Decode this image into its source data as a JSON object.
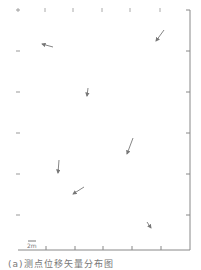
{
  "figure": {
    "type": "vector-field",
    "axis_color": "#888888",
    "arrow_color": "#777777",
    "axes": {
      "right_line": {
        "x": 190,
        "y1": 10,
        "y2": 250
      },
      "bottom_line": {
        "y": 250,
        "x1": 18,
        "x2": 190
      },
      "top_ticks_x": [
        18,
        45,
        73,
        102,
        130,
        160
      ],
      "left_ticks_y": [
        10,
        51,
        92,
        133,
        174,
        215
      ],
      "right_ticks_y": [
        10,
        51,
        92,
        133,
        174,
        215
      ],
      "bottom_ticks_x": [
        46,
        75,
        103,
        132,
        161
      ]
    },
    "arrows": [
      {
        "x1": 164,
        "y1": 30,
        "x2": 156,
        "y2": 41,
        "head": "end-top"
      },
      {
        "x1": 53,
        "y1": 47,
        "x2": 42,
        "y2": 44
      },
      {
        "x1": 88,
        "y1": 88,
        "x2": 87,
        "y2": 96
      },
      {
        "x1": 133,
        "y1": 138,
        "x2": 127,
        "y2": 154
      },
      {
        "x1": 59,
        "y1": 160,
        "x2": 58,
        "y2": 173
      },
      {
        "x1": 84,
        "y1": 187,
        "x2": 73,
        "y2": 194
      },
      {
        "x1": 147,
        "y1": 222,
        "x2": 151,
        "y2": 228
      }
    ],
    "scale_bar": {
      "x1": 28,
      "x2": 36,
      "y": 241,
      "label": "2m"
    }
  },
  "caption": "(a)测点位移矢量分布图"
}
